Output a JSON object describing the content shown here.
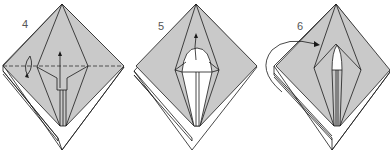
{
  "diagram": {
    "type": "origami instruction sequence",
    "colors": {
      "paper_gray": "#c9c9c9",
      "paper_white": "#ffffff",
      "line": "#1a1a1a",
      "label": "#555555"
    },
    "steps": [
      {
        "number": "4",
        "description": "Valley fold along dashed line; fold flap up (arrow up, turning arrow at left)"
      },
      {
        "number": "5",
        "description": "Inside fold of top flap with white rounded area; arrow up"
      },
      {
        "number": "6",
        "description": "Turn over / fold behind, curved arrow at left"
      }
    ]
  }
}
